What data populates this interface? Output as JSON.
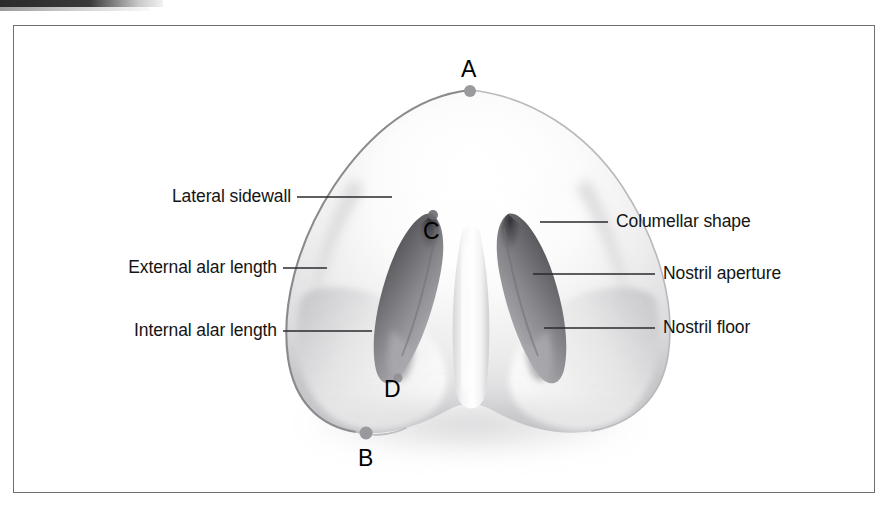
{
  "figure": {
    "view": "basal (worm's-eye) view of the nose",
    "frame_color": "#6f6f72",
    "background": "#ffffff"
  },
  "labels_left": [
    {
      "text": "Lateral sidewall",
      "name": "label-lateral-sidewall"
    },
    {
      "text": "External alar length",
      "name": "label-external-alar-length"
    },
    {
      "text": "Internal alar length",
      "name": "label-internal-alar-length"
    }
  ],
  "labels_right": [
    {
      "text": "Columellar shape",
      "name": "label-columellar-shape"
    },
    {
      "text": "Nostril aperture",
      "name": "label-nostril-aperture"
    },
    {
      "text": "Nostril floor",
      "name": "label-nostril-floor"
    }
  ],
  "points": [
    {
      "id": "A",
      "name": "point-a",
      "marker": true,
      "desc": "nasal tip / apex"
    },
    {
      "id": "B",
      "name": "point-b",
      "marker": true,
      "desc": "alar base lateral"
    },
    {
      "id": "C",
      "name": "point-c",
      "marker": false,
      "desc": "nostril apex"
    },
    {
      "id": "D",
      "name": "point-d",
      "marker": false,
      "desc": "nostril inferior"
    }
  ],
  "colors": {
    "leader_line": "#2a2a2e",
    "marker_dot": "#9a9a9e",
    "nose_outline": "#8f8f93",
    "nostril_dark": "#4a4a4e",
    "skin_light": "#f4f4f4",
    "skin_mid": "#d8d8da",
    "text": "#141414"
  }
}
